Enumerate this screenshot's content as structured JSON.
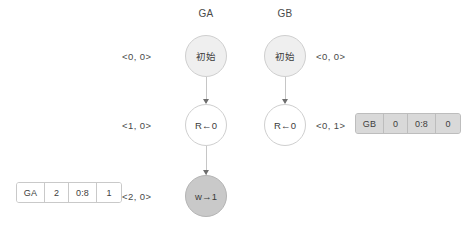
{
  "diagram": {
    "title_ga": "GA",
    "title_gb": "GB",
    "columns": [
      {
        "id": "GA",
        "label": "GA",
        "label_side": "left",
        "nodes": [
          {
            "id": "ga-init",
            "label": "初始",
            "fill": "light",
            "clock": "<0, 0>"
          },
          {
            "id": "ga-read",
            "label": "R←0",
            "fill": "white",
            "clock": "<1, 0>"
          },
          {
            "id": "ga-write",
            "label": "w→1",
            "fill": "dark",
            "clock": "<2, 0>"
          }
        ]
      },
      {
        "id": "GB",
        "label": "GB",
        "label_side": "right",
        "nodes": [
          {
            "id": "gb-init",
            "label": "初始",
            "fill": "light",
            "clock": "<0, 0>"
          },
          {
            "id": "gb-read",
            "label": "R←0",
            "fill": "white",
            "clock": "<0, 1>"
          }
        ]
      }
    ],
    "messages": [
      {
        "id": "msg-ga",
        "style": "white",
        "cells": [
          "GA",
          "2",
          "0:8",
          "1"
        ]
      },
      {
        "id": "msg-gb",
        "style": "gray",
        "cells": [
          "GB",
          "0",
          "0:8",
          "0"
        ]
      }
    ]
  }
}
